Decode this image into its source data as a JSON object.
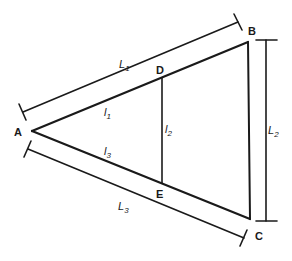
{
  "diagram": {
    "type": "triangle-similarity",
    "colors": {
      "stroke": "#1a1a1a",
      "background": "#ffffff"
    },
    "vertices": {
      "A": {
        "label": "A"
      },
      "B": {
        "label": "B"
      },
      "C": {
        "label": "C"
      },
      "D": {
        "label": "D"
      },
      "E": {
        "label": "E"
      }
    },
    "segments": {
      "l1": {
        "base": "l",
        "sub": "1"
      },
      "l2": {
        "base": "l",
        "sub": "2"
      },
      "l3": {
        "base": "l",
        "sub": "3"
      }
    },
    "dimensions": {
      "L1": {
        "base": "L",
        "sub": "1"
      },
      "L2": {
        "base": "L",
        "sub": "2"
      },
      "L3": {
        "base": "L",
        "sub": "3"
      }
    }
  }
}
